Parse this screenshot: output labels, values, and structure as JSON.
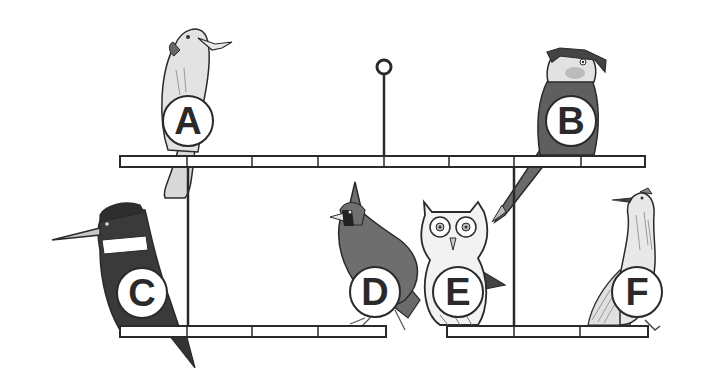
{
  "diagram": {
    "colors": {
      "line": "#2a2a2a",
      "bar_fill": "#ffffff",
      "light_gray": "#d9d9d9",
      "mid_gray": "#8a8a8a",
      "dark_gray": "#555555",
      "very_dark": "#333333"
    },
    "hanger": {
      "ring_cx": 384,
      "ring_cy": 67,
      "ring_r": 7,
      "stem_top": 74,
      "stem_bottom": 156
    },
    "bars": [
      {
        "name": "top-perch-bar",
        "x": 120,
        "y": 156,
        "width": 525,
        "height": 11,
        "dividers": [
          187,
          252,
          318,
          384,
          449,
          514,
          581
        ]
      },
      {
        "name": "bottom-left-perch-bar",
        "x": 120,
        "y": 326,
        "width": 266,
        "height": 11,
        "dividers": [
          187,
          252,
          318
        ]
      },
      {
        "name": "bottom-right-perch-bar",
        "x": 447,
        "y": 326,
        "width": 201,
        "height": 11,
        "dividers": [
          514,
          580
        ]
      }
    ],
    "rods": [
      {
        "name": "left-hanging-rod",
        "x": 188,
        "y1": 167,
        "y2": 326
      },
      {
        "name": "right-hanging-rod",
        "x": 514,
        "y1": 167,
        "y2": 326
      }
    ],
    "birds": [
      {
        "id": "A",
        "species": "cockatoo",
        "label": "A",
        "label_x": 188,
        "label_y": 121
      },
      {
        "id": "B",
        "species": "parrot",
        "label": "B",
        "label_x": 571,
        "label_y": 121
      },
      {
        "id": "C",
        "species": "kingfisher",
        "label": "C",
        "label_x": 142,
        "label_y": 293
      },
      {
        "id": "D",
        "species": "cardinal",
        "label": "D",
        "label_x": 375,
        "label_y": 292
      },
      {
        "id": "E",
        "species": "owl",
        "label": "E",
        "label_x": 458,
        "label_y": 292
      },
      {
        "id": "F",
        "species": "roadrunner",
        "label": "F",
        "label_x": 637,
        "label_y": 292
      }
    ]
  }
}
